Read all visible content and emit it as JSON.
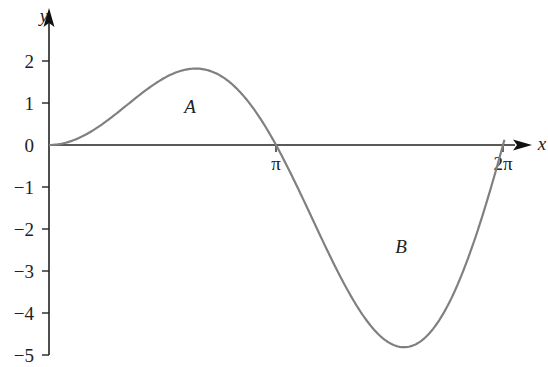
{
  "chart_data": {
    "type": "line",
    "title": "",
    "function": "y = x sin x",
    "xlabel": "x",
    "ylabel": "y",
    "x_ticks": [
      "π",
      "2π"
    ],
    "y_ticks": [
      "2",
      "1",
      "0",
      "−1",
      "−2",
      "−3",
      "−4",
      "−5"
    ],
    "xlim": [
      0,
      6.2832
    ],
    "ylim": [
      -5,
      2
    ],
    "grid": false,
    "annotations": [
      {
        "text": "A",
        "region": "area above x-axis between 0 and π"
      },
      {
        "text": "B",
        "region": "area below x-axis between π and 2π"
      }
    ],
    "series": [
      {
        "name": "curve",
        "color": "#808080",
        "x": [
          0,
          0.5,
          1.0,
          1.5,
          2.0,
          2.03,
          2.5,
          3.0,
          3.1416,
          3.5,
          4.0,
          4.5,
          4.91,
          5.5,
          6.0,
          6.2832
        ],
        "y": [
          0,
          0.24,
          0.84,
          1.5,
          1.82,
          1.82,
          1.5,
          0.42,
          0,
          -1.23,
          -3.03,
          -4.4,
          -4.81,
          -3.89,
          -1.68,
          0
        ]
      }
    ]
  },
  "labels": {
    "y_axis": "y",
    "x_axis": "x",
    "pi": "π",
    "two_pi": "2π",
    "region_a": "A",
    "region_b": "B",
    "y2": "2",
    "y1": "1",
    "y0": "0",
    "ym1": "−1",
    "ym2": "−2",
    "ym3": "−3",
    "ym4": "−4",
    "ym5": "−5"
  }
}
